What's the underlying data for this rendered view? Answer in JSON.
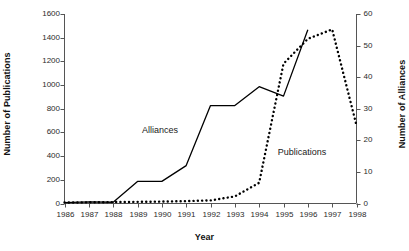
{
  "chart_data": {
    "type": "line",
    "title": "",
    "xlabel": "Year",
    "categories": [
      "1986",
      "1987",
      "1988",
      "1989",
      "1990",
      "1991",
      "1992",
      "1993",
      "1994",
      "1995",
      "1996",
      "1997",
      "1998"
    ],
    "grid": false,
    "legend_position": "inline-annotations",
    "axes": {
      "x": {
        "label": "Year",
        "ticks": [
          "1986",
          "1987",
          "1988",
          "1989",
          "1990",
          "1991",
          "1992",
          "1993",
          "1994",
          "1995",
          "1996",
          "1997",
          "1998"
        ]
      },
      "y_left": {
        "label": "Number of Publications",
        "ylim": [
          0,
          1600
        ],
        "ticks": [
          0,
          200,
          400,
          600,
          800,
          1000,
          1200,
          1400,
          1600
        ],
        "tick_labels": [
          "0",
          "200",
          "400",
          "600",
          "800",
          "1000",
          "1200",
          "1400",
          "1600"
        ]
      },
      "y_right": {
        "label": "Number of Alliances",
        "ylim": [
          0,
          60
        ],
        "ticks": [
          0,
          10,
          20,
          30,
          40,
          50,
          60
        ],
        "tick_labels": [
          "0",
          "10",
          "20",
          "30",
          "40",
          "50",
          "60"
        ]
      }
    },
    "series": [
      {
        "name": "Publications",
        "axis": "y_left",
        "style": "dotted",
        "color": "#000000",
        "annotation": "Publications",
        "values": [
          8,
          10,
          12,
          14,
          16,
          20,
          26,
          60,
          175,
          1180,
          1390,
          1470,
          660
        ]
      },
      {
        "name": "Alliances",
        "axis": "y_right",
        "style": "solid",
        "color": "#000000",
        "annotation": "Alliances",
        "values": [
          0.3,
          0.5,
          0.4,
          7,
          7,
          12,
          31,
          31,
          37,
          34,
          55,
          null,
          null
        ]
      }
    ],
    "annotations": [
      {
        "text": "Alliances",
        "x_pixel": 160,
        "y_pixel": 130
      },
      {
        "text": "Publications",
        "x_pixel": 302,
        "y_pixel": 152
      }
    ]
  },
  "colors": {
    "axis": "#555555",
    "line": "#000000",
    "text": "#1a1a1a",
    "background": "#ffffff"
  }
}
